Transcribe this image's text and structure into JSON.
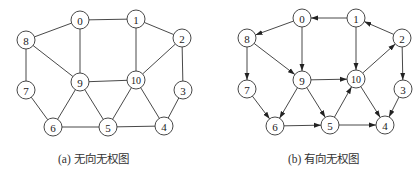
{
  "figures": [
    {
      "id": "a",
      "caption": "(a) 无向无权图",
      "directed": false,
      "offset_x": 0,
      "node_radius": 9,
      "nodes": [
        {
          "id": "0",
          "x": 80,
          "y": 20
        },
        {
          "id": "1",
          "x": 136,
          "y": 19
        },
        {
          "id": "2",
          "x": 182,
          "y": 38
        },
        {
          "id": "3",
          "x": 183,
          "y": 90
        },
        {
          "id": "4",
          "x": 164,
          "y": 126
        },
        {
          "id": "5",
          "x": 108,
          "y": 127
        },
        {
          "id": "6",
          "x": 53,
          "y": 127
        },
        {
          "id": "7",
          "x": 26,
          "y": 90
        },
        {
          "id": "8",
          "x": 26,
          "y": 40
        },
        {
          "id": "9",
          "x": 80,
          "y": 82
        },
        {
          "id": "10",
          "x": 136,
          "y": 80
        }
      ],
      "edges": [
        [
          "0",
          "1"
        ],
        [
          "0",
          "8"
        ],
        [
          "0",
          "9"
        ],
        [
          "1",
          "2"
        ],
        [
          "1",
          "10"
        ],
        [
          "2",
          "10"
        ],
        [
          "2",
          "3"
        ],
        [
          "3",
          "4"
        ],
        [
          "8",
          "9"
        ],
        [
          "8",
          "7"
        ],
        [
          "7",
          "6"
        ],
        [
          "9",
          "10"
        ],
        [
          "9",
          "6"
        ],
        [
          "9",
          "5"
        ],
        [
          "10",
          "5"
        ],
        [
          "10",
          "4"
        ],
        [
          "6",
          "5"
        ],
        [
          "5",
          "4"
        ]
      ]
    },
    {
      "id": "b",
      "caption": "(b) 有向无权图",
      "directed": true,
      "offset_x": 0,
      "node_radius": 9,
      "nodes": [
        {
          "id": "0",
          "x": 302,
          "y": 18
        },
        {
          "id": "1",
          "x": 356,
          "y": 18
        },
        {
          "id": "2",
          "x": 402,
          "y": 38
        },
        {
          "id": "3",
          "x": 403,
          "y": 89
        },
        {
          "id": "4",
          "x": 385,
          "y": 125
        },
        {
          "id": "5",
          "x": 330,
          "y": 125
        },
        {
          "id": "6",
          "x": 275,
          "y": 126
        },
        {
          "id": "7",
          "x": 247,
          "y": 89
        },
        {
          "id": "8",
          "x": 247,
          "y": 38
        },
        {
          "id": "9",
          "x": 302,
          "y": 80
        },
        {
          "id": "10",
          "x": 356,
          "y": 79
        }
      ],
      "edges": [
        [
          "1",
          "0"
        ],
        [
          "0",
          "8"
        ],
        [
          "0",
          "9"
        ],
        [
          "8",
          "9"
        ],
        [
          "8",
          "7"
        ],
        [
          "7",
          "6"
        ],
        [
          "9",
          "6"
        ],
        [
          "9",
          "5"
        ],
        [
          "9",
          "10"
        ],
        [
          "6",
          "5"
        ],
        [
          "5",
          "10"
        ],
        [
          "5",
          "4"
        ],
        [
          "10",
          "4"
        ],
        [
          "10",
          "2"
        ],
        [
          "2",
          "1"
        ],
        [
          "1",
          "10"
        ],
        [
          "2",
          "3"
        ],
        [
          "3",
          "4"
        ]
      ]
    }
  ]
}
